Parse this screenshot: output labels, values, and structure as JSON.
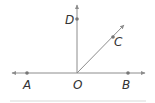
{
  "diagram": {
    "colors": {
      "line": "#8c8c8c",
      "point": "#777777",
      "label": "#333333",
      "baseline": "#e6e6e6"
    },
    "points": [
      {
        "id": "A",
        "label": "A",
        "x": 27,
        "y": 73
      },
      {
        "id": "O",
        "label": "O",
        "x": 77,
        "y": 73
      },
      {
        "id": "B",
        "label": "B",
        "x": 128,
        "y": 73
      },
      {
        "id": "D",
        "label": "D",
        "x": 77,
        "y": 19
      },
      {
        "id": "C",
        "label": "C",
        "x": 113,
        "y": 37
      }
    ],
    "lines": [
      {
        "id": "line-AB",
        "type": "line",
        "through": [
          "A",
          "O",
          "B"
        ]
      },
      {
        "id": "ray-OD",
        "type": "ray",
        "from": "O",
        "through": "D"
      },
      {
        "id": "ray-OC",
        "type": "ray",
        "from": "O",
        "through": "C"
      }
    ]
  }
}
